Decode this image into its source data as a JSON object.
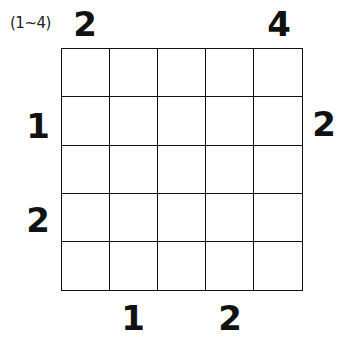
{
  "puzzle": {
    "range_label": "(1~4)",
    "size": 5,
    "clues": {
      "top": [
        "2",
        "",
        "",
        "",
        "4"
      ],
      "bottom": [
        "",
        "1",
        "",
        "2",
        ""
      ],
      "left": [
        "",
        "1",
        "",
        "2",
        ""
      ],
      "right": [
        "",
        "2",
        "",
        "",
        ""
      ]
    },
    "cells": [
      [
        "",
        "",
        "",
        "",
        ""
      ],
      [
        "",
        "",
        "",
        "",
        ""
      ],
      [
        "",
        "",
        "",
        "",
        ""
      ],
      [
        "",
        "",
        "",
        "",
        ""
      ],
      [
        "",
        "",
        "",
        "",
        ""
      ]
    ]
  }
}
